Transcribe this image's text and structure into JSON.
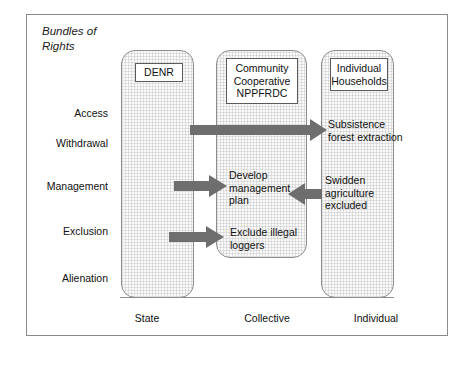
{
  "figure": {
    "title": "Bundles of Rights",
    "title_line1": "Bundles of",
    "title_line2": "Rights"
  },
  "rights_rows": [
    {
      "id": "access",
      "label": "Access"
    },
    {
      "id": "withdrawal",
      "label": "Withdrawal"
    },
    {
      "id": "management",
      "label": "Management"
    },
    {
      "id": "exclusion",
      "label": "Exclusion"
    },
    {
      "id": "alienation",
      "label": "Alienation"
    }
  ],
  "domains": [
    {
      "id": "state",
      "axis_label": "State",
      "actor": "DENR"
    },
    {
      "id": "collective",
      "axis_label": "Collective",
      "actor": "Community Cooperative NPPFRDC"
    },
    {
      "id": "individual",
      "axis_label": "Individual",
      "actor": "Individual Households"
    }
  ],
  "actors": {
    "state": "DENR",
    "collective_line1": "Community",
    "collective_line2": "Cooperative",
    "collective_line3": "NPPFRDC",
    "individual_line1": "Individual",
    "individual_line2": "Households"
  },
  "annotations": [
    {
      "id": "subsistence-forest-extraction",
      "text": "Subsistence forest extraction",
      "row": "withdrawal",
      "target_domain": "individual"
    },
    {
      "id": "develop-management-plan",
      "text": "Develop management plan",
      "row": "management",
      "target_domain": "collective"
    },
    {
      "id": "swidden-agriculture-excluded",
      "text": "Swidden agriculture excluded",
      "row": "management",
      "target_domain": "collective"
    },
    {
      "id": "exclude-illegal-loggers",
      "text": "Exclude illegal loggers",
      "row": "exclusion",
      "target_domain": "collective"
    }
  ],
  "annotation_text": {
    "subsistence": "Subsistence forest extraction",
    "develop": "Develop management plan",
    "swidden": "Swidden agriculture excluded",
    "exclude": "Exclude illegal loggers"
  },
  "arrows": [
    {
      "id": "arrow-state-to-individual",
      "direction": "right",
      "from": "state",
      "to": "individual",
      "row": "withdrawal"
    },
    {
      "id": "arrow-state-to-collective-management",
      "direction": "right",
      "from": "state",
      "to": "collective",
      "row": "management"
    },
    {
      "id": "arrow-individual-to-collective-swidden",
      "direction": "left",
      "from": "individual",
      "to": "collective",
      "row": "management"
    },
    {
      "id": "arrow-state-to-collective-exclusion",
      "direction": "right",
      "from": "state",
      "to": "collective",
      "row": "exclusion"
    }
  ],
  "colors": {
    "arrow_fill": "#6e6e6e",
    "panel_fill": "#fafafa",
    "panel_border": "#8d8d8d",
    "frame_border": "#8a8a8a",
    "text": "#111111"
  }
}
